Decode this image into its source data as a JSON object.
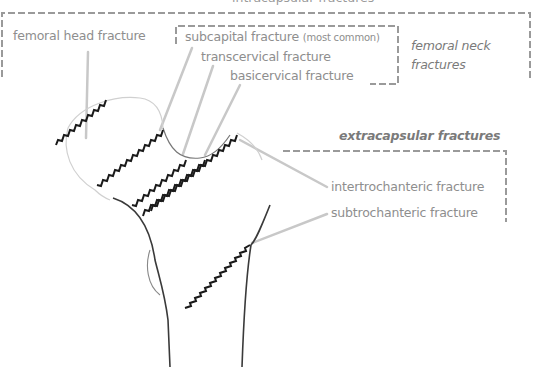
{
  "diagram": {
    "groups": {
      "intracapsular": "intracapsular fractures",
      "femoral_neck_line1": "femoral neck",
      "femoral_neck_line2": "fractures",
      "extracapsular": "extracapsular fractures"
    },
    "labels": {
      "femoral_head": "femoral head fracture",
      "subcapital": "subcapital fracture",
      "subcapital_note": "(most common)",
      "transcervical": "transcervical fracture",
      "basicervical": "basicervical fracture",
      "intertrochanteric": "intertrochanteric fracture",
      "subtrochanteric": "subtrochanteric fracture"
    },
    "colors": {
      "label_text": "#8e8e8e",
      "dashed_bracket": "#9a9a9a",
      "leader_line": "#c4c4c4",
      "fracture_line": "#1a1a1a",
      "bone_outline": "#3a3a3a"
    }
  }
}
